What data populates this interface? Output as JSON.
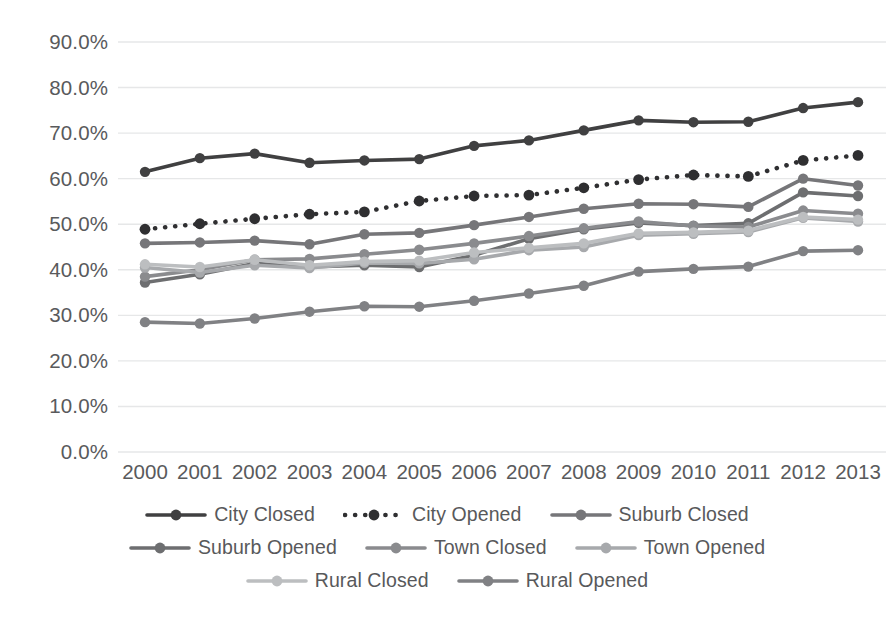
{
  "chart_data": {
    "type": "line",
    "title": "",
    "subtitle": "",
    "xlabel": "",
    "ylabel": "",
    "categories": [
      "2000",
      "2001",
      "2002",
      "2003",
      "2004",
      "2005",
      "2006",
      "2007",
      "2008",
      "2009",
      "2010",
      "2011",
      "2012",
      "2013"
    ],
    "x": [
      2000,
      2001,
      2002,
      2003,
      2004,
      2005,
      2006,
      2007,
      2008,
      2009,
      2010,
      2011,
      2012,
      2013
    ],
    "ylim": [
      0,
      90
    ],
    "ytick_labels": [
      "0.0%",
      "10.0%",
      "20.0%",
      "30.0%",
      "40.0%",
      "50.0%",
      "60.0%",
      "70.0%",
      "80.0%",
      "90.0%"
    ],
    "ytick_values": [
      0,
      10,
      20,
      30,
      40,
      50,
      60,
      70,
      80,
      90
    ],
    "y_unit": "%",
    "grid": "horizontal",
    "legend_position": "bottom",
    "series": [
      {
        "name": "City Closed",
        "color": "#404041",
        "style": "solid",
        "marker": "circle",
        "values": [
          61.5,
          64.5,
          65.5,
          63.5,
          64.0,
          64.3,
          67.2,
          68.4,
          70.6,
          72.8,
          72.4,
          72.5,
          75.5,
          76.8
        ]
      },
      {
        "name": "City Opened",
        "color": "#2f2f31",
        "style": "dotted",
        "marker": "circle",
        "values": [
          48.9,
          50.1,
          51.2,
          52.2,
          52.7,
          55.1,
          56.2,
          56.4,
          58.0,
          59.8,
          60.8,
          60.5,
          64.0,
          65.1
        ]
      },
      {
        "name": "Suburb Closed",
        "color": "#767679",
        "style": "solid",
        "marker": "circle",
        "values": [
          45.8,
          46.0,
          46.4,
          45.6,
          47.8,
          48.1,
          49.8,
          51.6,
          53.4,
          54.5,
          54.4,
          53.8,
          60.0,
          58.5
        ]
      },
      {
        "name": "Suburb Opened",
        "color": "#6d6e70",
        "style": "solid",
        "marker": "circle",
        "values": [
          37.2,
          39.0,
          41.4,
          40.6,
          41.0,
          40.6,
          43.2,
          46.8,
          48.9,
          50.3,
          49.7,
          50.2,
          57.0,
          56.2
        ]
      },
      {
        "name": "Town Closed",
        "color": "#8a8b8e",
        "style": "solid",
        "marker": "circle",
        "values": [
          38.5,
          40.0,
          42.2,
          42.4,
          43.4,
          44.4,
          45.8,
          47.4,
          49.1,
          50.6,
          49.6,
          49.4,
          53.0,
          52.3
        ]
      },
      {
        "name": "Town Opened",
        "color": "#a7a9ac",
        "style": "solid",
        "marker": "circle",
        "values": [
          40.5,
          39.4,
          41.0,
          40.4,
          41.5,
          41.4,
          42.3,
          44.3,
          45.0,
          47.6,
          47.9,
          48.3,
          51.4,
          50.6
        ]
      },
      {
        "name": "Rural Closed",
        "color": "#bcbec0",
        "style": "solid",
        "marker": "circle",
        "values": [
          41.2,
          40.6,
          42.2,
          41.0,
          41.8,
          42.0,
          43.8,
          44.8,
          45.8,
          48.0,
          48.2,
          48.6,
          51.6,
          51.0
        ]
      },
      {
        "name": "Rural Opened",
        "color": "#808184",
        "style": "solid",
        "marker": "circle",
        "values": [
          28.5,
          28.2,
          29.3,
          30.8,
          32.0,
          31.9,
          33.2,
          34.8,
          36.5,
          39.6,
          40.2,
          40.7,
          44.1,
          44.3
        ]
      }
    ]
  },
  "legend": {
    "rows": [
      [
        "City Closed",
        "City Opened",
        "Suburb Closed"
      ],
      [
        "Suburb Opened",
        "Town Closed",
        "Town Opened"
      ],
      [
        "Rural Closed",
        "Rural Opened"
      ]
    ]
  },
  "colors": {
    "grid": "#e6e7e8",
    "text": "#58595b",
    "background": "#ffffff"
  }
}
